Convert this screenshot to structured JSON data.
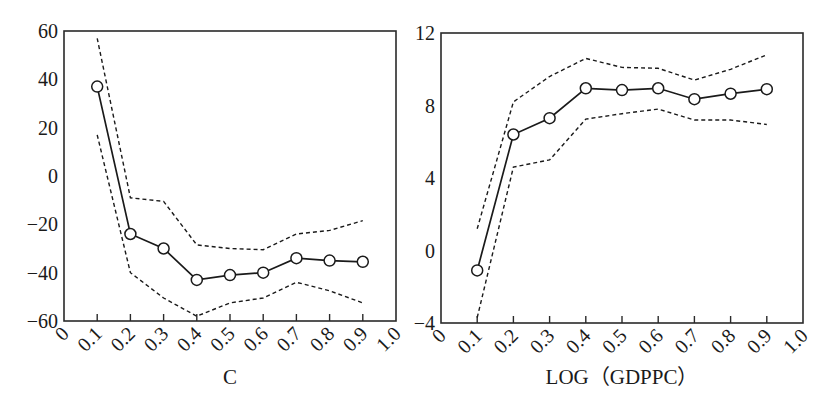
{
  "chart_data": [
    {
      "type": "line",
      "title": "",
      "xlabel": "C",
      "ylabel": "",
      "xlim": [
        0,
        1.0
      ],
      "ylim": [
        -60,
        60
      ],
      "x_ticks": [
        "0",
        "0.1",
        "0.2",
        "0.3",
        "0.4",
        "0.5",
        "0.6",
        "0.7",
        "0.8",
        "0.9",
        "1.0"
      ],
      "y_ticks": [
        "60",
        "40",
        "20",
        "0",
        "-20",
        "-40",
        "-60"
      ],
      "y_tick_values": [
        60,
        40,
        20,
        0,
        -20,
        -40,
        -60
      ],
      "x": [
        0.1,
        0.2,
        0.3,
        0.4,
        0.5,
        0.6,
        0.7,
        0.8,
        0.9
      ],
      "series": [
        {
          "name": "estimate",
          "style": "solid-circle",
          "values": [
            37,
            -24,
            -30,
            -43,
            -41,
            -40,
            -34,
            -35,
            -35.5
          ]
        },
        {
          "name": "upper bound",
          "style": "dashed",
          "values": [
            57,
            -9,
            -10.5,
            -28.5,
            -30,
            -30.5,
            -24,
            -22.5,
            -18.5
          ]
        },
        {
          "name": "lower bound",
          "style": "dashed",
          "values": [
            17,
            -40,
            -50.5,
            -58,
            -52.5,
            -50.5,
            -44,
            -47.5,
            -52.5
          ]
        }
      ],
      "grid": false,
      "legend": null
    },
    {
      "type": "line",
      "title": "",
      "xlabel": "LOG（GDPPC）",
      "ylabel": "",
      "xlim": [
        0,
        1.0
      ],
      "ylim": [
        -4,
        12
      ],
      "x_ticks": [
        "0",
        "0.1",
        "0.2",
        "0.3",
        "0.4",
        "0.5",
        "0.6",
        "0.7",
        "0.8",
        "0.9",
        "1.0"
      ],
      "y_ticks": [
        "12",
        "8",
        "4",
        "0",
        "-4"
      ],
      "y_tick_values": [
        12,
        8,
        4,
        0,
        -4
      ],
      "x": [
        0.1,
        0.2,
        0.3,
        0.4,
        0.5,
        0.6,
        0.7,
        0.8,
        0.9
      ],
      "series": [
        {
          "name": "estimate",
          "style": "solid-circle",
          "values": [
            -1.1,
            6.4,
            7.3,
            8.95,
            8.85,
            8.95,
            8.35,
            8.65,
            8.9
          ]
        },
        {
          "name": "upper bound",
          "style": "dashed",
          "values": [
            1.2,
            8.2,
            9.6,
            10.6,
            10.1,
            10.05,
            9.4,
            10.0,
            10.8
          ]
        },
        {
          "name": "lower bound",
          "style": "dashed",
          "values": [
            -3.7,
            4.6,
            5.0,
            7.25,
            7.55,
            7.8,
            7.2,
            7.2,
            6.95
          ]
        }
      ],
      "grid": false,
      "legend": null
    }
  ]
}
